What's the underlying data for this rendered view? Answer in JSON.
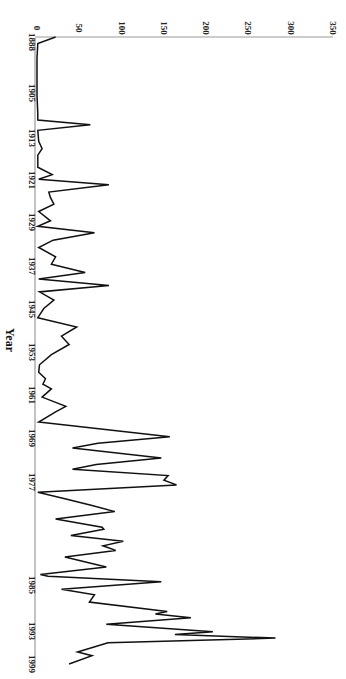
{
  "chart_data": {
    "type": "line",
    "orientation": "rotated-90-clockwise",
    "title": "",
    "xlabel": "Year",
    "ylabel": "",
    "ylim": [
      0,
      350
    ],
    "y_ticks": [
      0,
      50,
      100,
      150,
      200,
      250,
      300,
      350
    ],
    "x_tick_labels": [
      "1888",
      "1905",
      "1913",
      "1921",
      "1929",
      "1937",
      "1945",
      "1953",
      "1961",
      "1969",
      "1977",
      "1985",
      "1993",
      "1999"
    ],
    "x_tick_positions": [
      42,
      93,
      138,
      180,
      222,
      266,
      309,
      352,
      395,
      438,
      482,
      585,
      631,
      664
    ],
    "grid": false,
    "legend": null,
    "series": [
      {
        "name": "value",
        "color": "#111111",
        "points": [
          [
            37,
            22
          ],
          [
            44,
            1
          ],
          [
            60,
            0
          ],
          [
            100,
            0
          ],
          [
            120,
            1
          ],
          [
            127,
            1
          ],
          [
            132,
            63
          ],
          [
            138,
            1
          ],
          [
            150,
            2
          ],
          [
            158,
            6
          ],
          [
            165,
            1
          ],
          [
            178,
            1
          ],
          [
            186,
            18
          ],
          [
            191,
            2
          ],
          [
            197,
            85
          ],
          [
            205,
            14
          ],
          [
            211,
            16
          ],
          [
            218,
            20
          ],
          [
            226,
            2
          ],
          [
            236,
            16
          ],
          [
            242,
            1
          ],
          [
            249,
            68
          ],
          [
            257,
            19
          ],
          [
            265,
            2
          ],
          [
            275,
            22
          ],
          [
            283,
            17
          ],
          [
            292,
            57
          ],
          [
            299,
            2
          ],
          [
            306,
            85
          ],
          [
            313,
            3
          ],
          [
            322,
            20
          ],
          [
            331,
            8
          ],
          [
            341,
            1
          ],
          [
            351,
            47
          ],
          [
            361,
            29
          ],
          [
            370,
            38
          ],
          [
            381,
            17
          ],
          [
            392,
            3
          ],
          [
            400,
            2
          ],
          [
            407,
            10
          ],
          [
            413,
            7
          ],
          [
            418,
            17
          ],
          [
            427,
            6
          ],
          [
            437,
            34
          ],
          [
            443,
            22
          ],
          [
            454,
            2
          ],
          [
            470,
            157
          ],
          [
            477,
            72
          ],
          [
            482,
            42
          ],
          [
            493,
            147
          ],
          [
            500,
            70
          ],
          [
            505,
            42
          ],
          [
            512,
            155
          ],
          [
            517,
            150
          ],
          [
            522,
            165
          ],
          [
            530,
            1
          ],
          [
            537,
            33
          ],
          [
            544,
            64
          ],
          [
            551,
            92
          ],
          [
            559,
            22
          ],
          [
            568,
            77
          ],
          [
            570,
            79
          ],
          [
            577,
            40
          ],
          [
            583,
            102
          ],
          [
            588,
            78
          ],
          [
            593,
            93
          ],
          [
            600,
            33
          ],
          [
            611,
            82
          ],
          [
            619,
            4
          ],
          [
            621,
            13
          ],
          [
            627,
            147
          ],
          [
            635,
            29
          ],
          [
            641,
            68
          ],
          [
            649,
            62
          ],
          [
            659,
            154
          ],
          [
            662,
            140
          ],
          [
            666,
            182
          ],
          [
            673,
            82
          ],
          [
            681,
            208
          ],
          [
            684,
            163
          ],
          [
            688,
            282
          ],
          [
            693,
            84
          ],
          [
            703,
            48
          ],
          [
            707,
            65
          ],
          [
            716,
            38
          ]
        ]
      }
    ],
    "plot_area": {
      "left": 37,
      "right": 333,
      "top": 37,
      "bottom": 668
    }
  }
}
